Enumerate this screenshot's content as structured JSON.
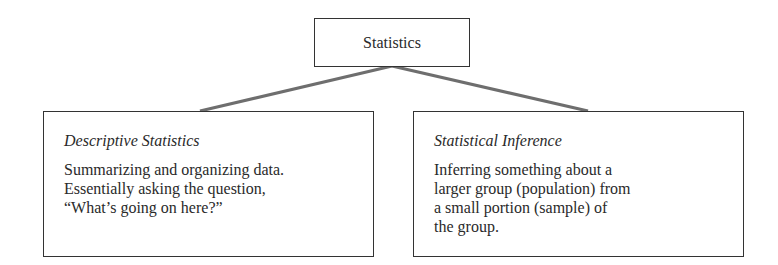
{
  "diagram": {
    "root": {
      "label": "Statistics"
    },
    "branches": [
      {
        "title": "Descriptive Statistics",
        "description_lines": [
          "Summarizing and organizing data.",
          "Essentially asking the question,",
          "“What’s going on here?”"
        ]
      },
      {
        "title": "Statistical Inference",
        "description_lines": [
          "Inferring something about a",
          "larger group (population) from",
          "a small portion (sample) of",
          "the group."
        ]
      }
    ],
    "connector_color": "#6e6e6e"
  }
}
